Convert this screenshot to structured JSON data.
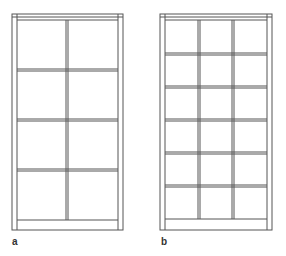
{
  "figure": {
    "panels": [
      {
        "label": "a",
        "columns": 2,
        "rows": 4,
        "description": "Window frame with 2x4 glazing grid"
      },
      {
        "label": "b",
        "columns": 3,
        "rows": 6,
        "description": "Window frame with 3x6 glazing grid"
      }
    ],
    "stroke_color": "#555555",
    "background": "#ffffff"
  }
}
